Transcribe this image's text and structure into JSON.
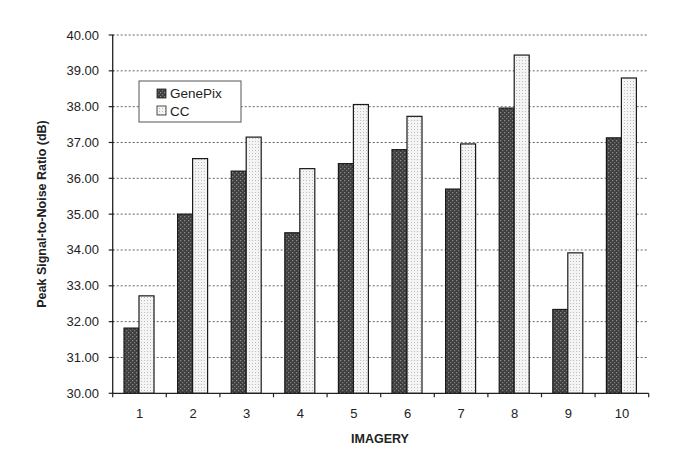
{
  "chart_data": {
    "type": "bar",
    "title": "",
    "xlabel": "IMAGERY",
    "ylabel": "Peak Signal-to-Noise Ratio (dB)",
    "ylim": [
      30,
      40
    ],
    "yticks": [
      "30.00",
      "31.00",
      "32.00",
      "33.00",
      "34.00",
      "35.00",
      "36.00",
      "37.00",
      "38.00",
      "39.00",
      "40.00"
    ],
    "grid": "horizontal dotted",
    "legend_position": "upper-left inside",
    "categories": [
      "1",
      "2",
      "3",
      "4",
      "5",
      "6",
      "7",
      "8",
      "9",
      "10"
    ],
    "series": [
      {
        "name": "GenePix",
        "color": "#4a4a4a",
        "values": [
          31.82,
          35.0,
          36.2,
          34.48,
          36.41,
          36.8,
          35.7,
          37.96,
          32.34,
          37.13
        ]
      },
      {
        "name": "CC",
        "color": "#e0e0e0",
        "values": [
          32.72,
          36.55,
          37.15,
          36.27,
          38.06,
          37.73,
          36.96,
          39.44,
          33.92,
          38.8
        ]
      }
    ]
  },
  "legend": {
    "items": [
      {
        "label": "GenePix"
      },
      {
        "label": "CC"
      }
    ]
  }
}
